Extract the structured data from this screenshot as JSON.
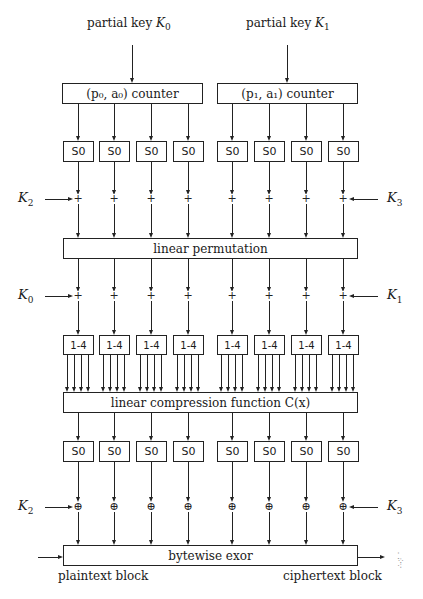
{
  "clipped_top_text": "…",
  "inputs": {
    "left_key_label": "partial key ",
    "left_key_sym": "K",
    "left_key_sub": "0",
    "right_key_label": "partial key ",
    "right_key_sym": "K",
    "right_key_sub": "1"
  },
  "counters": {
    "left": "(p₀, a₀) counter",
    "right": "(p₁, a₁) counter"
  },
  "sbox_label": "S0",
  "expander_label": "1-4",
  "ops": {
    "add": "+",
    "xor": "⊕"
  },
  "keys_row1": {
    "left_sym": "K",
    "left_sub": "2",
    "right_sym": "K",
    "right_sub": "3"
  },
  "keys_row2": {
    "left_sym": "K",
    "left_sub": "0",
    "right_sym": "K",
    "right_sub": "1"
  },
  "keys_row3": {
    "left_sym": "K",
    "left_sub": "2",
    "right_sym": "K",
    "right_sub": "3"
  },
  "blocks": {
    "permutation": "linear permutation",
    "compression": "linear compression function C(x)",
    "exor": "bytewise exor"
  },
  "io": {
    "plaintext": "plaintext block",
    "ciphertext": "ciphertext block"
  }
}
